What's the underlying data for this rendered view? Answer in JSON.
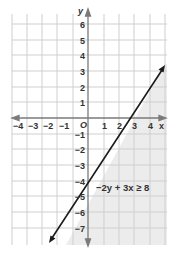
{
  "graph": {
    "x_axis_label": "x",
    "y_axis_label": "y",
    "origin_label": "O",
    "x_tick_labels": [
      "−4",
      "−3",
      "−2",
      "−1",
      "1",
      "2",
      "3",
      "4"
    ],
    "x_tick_values": [
      -4,
      -3,
      -2,
      -1,
      1,
      2,
      3,
      4
    ],
    "y_tick_labels": [
      "6",
      "5",
      "4",
      "3",
      "2",
      "1",
      "−1",
      "−2",
      "−3",
      "−4",
      "−5",
      "−6",
      "−7"
    ],
    "y_tick_values": [
      6,
      5,
      4,
      3,
      2,
      1,
      -1,
      -2,
      -3,
      -4,
      -5,
      -6,
      -7
    ],
    "inequality_label": "−2y + 3x ≥ 8",
    "boundary_line": {
      "slope": 1.5,
      "y_intercept": -4,
      "x_intercept": 2.6667,
      "style": "solid"
    },
    "shaded_region": "below-right of line",
    "colors": {
      "shade": "#ededed",
      "grid": "#cfcfcf",
      "axis": "#7a7a7a",
      "line": "#1a1a1a"
    }
  }
}
